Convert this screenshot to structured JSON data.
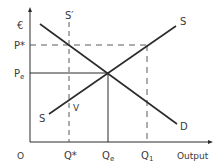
{
  "diagram": {
    "type": "supply-demand",
    "axes": {
      "y_label": "€",
      "x_label": "Output",
      "origin_label": "O"
    },
    "price_labels": {
      "p_star": "P*",
      "p_e": "Pe"
    },
    "quantity_labels": {
      "q_star": "Q*",
      "q_e": "Qe",
      "q_1": "Q1"
    },
    "curves": {
      "supply_label_top": "S",
      "supply_label_bottom": "S",
      "demand_label": "D",
      "s_prime_label": "S′",
      "point_label": "V"
    },
    "colors": {
      "line": "#2b2b2b",
      "dash": "#5a5a5a",
      "text": "#3a3a3a"
    }
  }
}
